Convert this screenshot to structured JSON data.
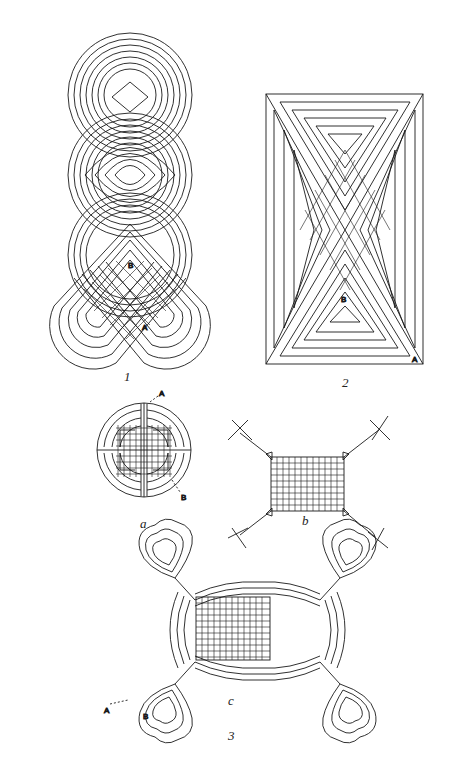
{
  "plate": {
    "figures": [
      {
        "id": "fig-1",
        "caption": "1",
        "point_labels": [
          "A",
          "B"
        ]
      },
      {
        "id": "fig-2",
        "caption": "2",
        "point_labels": [
          "A",
          "B"
        ]
      },
      {
        "id": "fig-3",
        "caption": "3",
        "subfigures": [
          {
            "id": "a",
            "caption": "a",
            "point_labels": [
              "A",
              "B"
            ]
          },
          {
            "id": "b",
            "caption": "b"
          },
          {
            "id": "c",
            "caption": "c",
            "point_labels": [
              "A",
              "B"
            ]
          }
        ]
      }
    ]
  },
  "colors": {
    "ink": "#1a1a1a",
    "paper": "#ffffff"
  }
}
